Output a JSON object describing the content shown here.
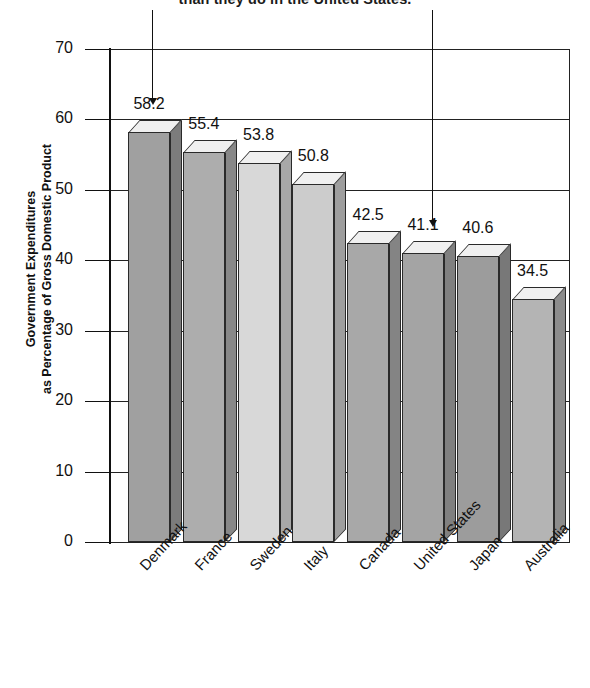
{
  "caption": "than they do in the United States.",
  "y_axis_title_line1": "Government Expenditures",
  "y_axis_title_line2": "as Percentage of Gross Domestic Product",
  "chart_data": {
    "type": "bar",
    "title": "than they do in the United States.",
    "xlabel": "",
    "ylabel": "Government Expenditures as Percentage of Gross Domestic Product",
    "categories": [
      "Denmark",
      "France",
      "Sweden",
      "Italy",
      "Canada",
      "United States",
      "Japan",
      "Australia"
    ],
    "values": [
      58.2,
      55.4,
      53.8,
      50.8,
      42.5,
      41.1,
      40.6,
      34.5
    ],
    "value_labels": [
      "58.2",
      "55.4",
      "53.8",
      "50.8",
      "42.5",
      "41.1",
      "40.6",
      "34.5"
    ],
    "ylim": [
      0,
      70
    ],
    "yticks": [
      0,
      10,
      20,
      30,
      40,
      50,
      60,
      70
    ],
    "ytick_labels": [
      "0",
      "10",
      "20",
      "30",
      "40",
      "50",
      "60",
      "70"
    ],
    "grid": true,
    "legend": false,
    "style": "3d-bars",
    "bar_colors": [
      "#a0a0a0",
      "#adadad",
      "#d8d8d8",
      "#cccccc",
      "#a8a8a8",
      "#a4a4a4",
      "#9c9c9c",
      "#b4b4b4"
    ],
    "bar_side_colors": [
      "#7c7c7c",
      "#888888",
      "#a8a8a8",
      "#9e9e9e",
      "#848484",
      "#808080",
      "#787878",
      "#8c8c8c"
    ],
    "bar_top_color": "#f0f0f0",
    "annotations": [
      {
        "name": "arrow-denmark",
        "target_category": "Denmark",
        "x": 152,
        "y_top": 10,
        "y_bottom": 104
      },
      {
        "name": "arrow-united-states",
        "target_category": "United States",
        "x": 432,
        "y_top": 10,
        "y_bottom": 226
      }
    ]
  }
}
